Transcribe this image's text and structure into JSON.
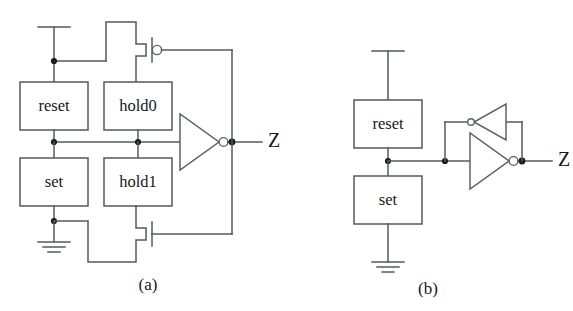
{
  "figure": {
    "background_color": "#ffffff",
    "line_color": "#555a5e",
    "text_color": "#17181a",
    "panels": [
      {
        "id": "panel-a",
        "caption": "(a)",
        "boxes": [
          {
            "id": "reset",
            "label": "reset"
          },
          {
            "id": "hold0",
            "label": "hold0"
          },
          {
            "id": "set",
            "label": "set"
          },
          {
            "id": "hold1",
            "label": "hold1"
          }
        ],
        "output_label": "Z",
        "transistors": [
          {
            "id": "pmos-top",
            "type": "pmos",
            "has_gate_bubble": true
          },
          {
            "id": "nmos-bottom",
            "type": "nmos",
            "has_gate_bubble": false
          }
        ],
        "inverters": [
          {
            "id": "output-inverter",
            "direction": "right",
            "has_output_bubble": true
          }
        ],
        "power": {
          "vdd": true,
          "gnd": true
        }
      },
      {
        "id": "panel-b",
        "caption": "(b)",
        "boxes": [
          {
            "id": "reset",
            "label": "reset"
          },
          {
            "id": "set",
            "label": "set"
          }
        ],
        "output_label": "Z",
        "transistors": [],
        "inverters": [
          {
            "id": "output-inverter",
            "direction": "right",
            "has_output_bubble": true
          },
          {
            "id": "feedback-inverter",
            "direction": "left",
            "has_output_bubble": true
          }
        ],
        "power": {
          "vdd": true,
          "gnd": true
        }
      }
    ]
  }
}
